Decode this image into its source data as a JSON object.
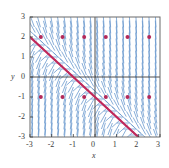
{
  "chart_data": {
    "type": "scatter",
    "title": "",
    "xlabel": "x",
    "ylabel": "y",
    "xlim": [
      -3,
      3
    ],
    "ylim": [
      -3,
      3
    ],
    "grid": false,
    "xticks": [
      -3,
      -2,
      -1,
      0,
      1,
      2,
      3
    ],
    "yticks": [
      -3,
      -2,
      -1,
      0,
      1,
      2,
      3
    ],
    "xtick_labels": [
      "-3",
      "-2",
      "-1",
      "0",
      "1",
      "2",
      "3"
    ],
    "ytick_labels": [
      "-3",
      "-2",
      "-1",
      "0",
      "1",
      "2",
      "3"
    ],
    "series": [
      {
        "name": "slope-field",
        "type": "quiver",
        "color": "#5b8fc9",
        "description": "direction field of dy/dx, short blue dash segments on a grid",
        "grid_step": 0.3,
        "slope_formula": "-(x+y+1)*3"
      },
      {
        "name": "equilibrium-line",
        "type": "line",
        "color": "#c0285a",
        "points": [
          [
            -3,
            2
          ],
          [
            2,
            -3
          ]
        ],
        "equation": "y = -x - 1",
        "linewidth": 2.2
      },
      {
        "name": "marked-points",
        "type": "scatter",
        "color": "#b3295a",
        "marker": "dot",
        "x": [
          -2.5,
          -1.5,
          -0.5,
          0.5,
          1.5,
          2.5,
          -2.5,
          -1.5,
          -0.5,
          0.5,
          1.5,
          2.5
        ],
        "y": [
          2,
          2,
          2,
          2,
          2,
          2,
          -1,
          -1,
          -1,
          -1,
          -1,
          -1
        ]
      }
    ],
    "axes": {
      "zero_x_line": true,
      "zero_y_line": true,
      "frame": true,
      "frame_color": "#555555",
      "axis_line_color": "#3a3a3a"
    },
    "colors": {
      "field": "#5b8fc9",
      "solution": "#c0285a",
      "dot": "#b3295a",
      "text": "#3a3a3a",
      "frame": "#6a6a6a",
      "background": "#ffffff"
    }
  }
}
